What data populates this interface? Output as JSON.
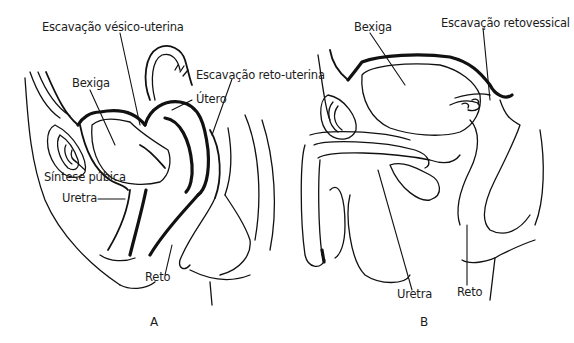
{
  "figure": {
    "panels": [
      {
        "id": "A",
        "caption": "A",
        "labels": {
          "escavacao_vesico_uterina": "Escavação vésico-uterina",
          "bexiga": "Bexiga",
          "escavacao_reto_uterina": "Escavação reto-uterina",
          "utero": "Útero",
          "sintese_pubica": "Síntese púbica",
          "uretra": "Uretra",
          "reto": "Reto"
        }
      },
      {
        "id": "B",
        "caption": "B",
        "labels": {
          "bexiga": "Bexiga",
          "escavacao_retovessical": "Escavação retovessical",
          "uretra": "Uretra",
          "reto": "Reto"
        }
      }
    ],
    "colors": {
      "line": "#111111",
      "text": "#1c1c1c",
      "background": "#ffffff"
    }
  }
}
